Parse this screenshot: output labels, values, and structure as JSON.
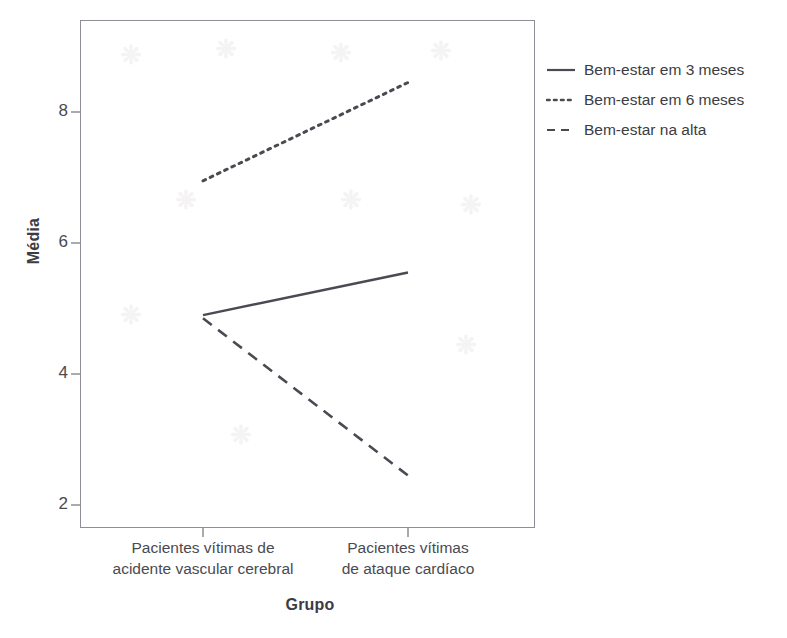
{
  "chart_data": {
    "type": "line",
    "title": "",
    "xlabel": "Grupo",
    "ylabel": "Média",
    "categories": [
      "Pacientes vítimas de\nacidente vascular cerebral",
      "Pacientes vítimas\nde ataque cardíaco"
    ],
    "x": [
      1,
      2
    ],
    "ylim": [
      1.45,
      9.2
    ],
    "yticks": [
      2,
      4,
      6,
      8
    ],
    "ytick_labels": [
      "2",
      "4",
      "6",
      "8"
    ],
    "grid": false,
    "legend_position": "right",
    "series": [
      {
        "name": "Bem-estar em 3 meses",
        "style": "solid",
        "values": [
          4.9,
          5.55
        ]
      },
      {
        "name": "Bem-estar em 6 meses",
        "style": "dotted",
        "values": [
          6.95,
          8.45
        ]
      },
      {
        "name": "Bem-estar na alta",
        "style": "dashed",
        "values": [
          4.85,
          2.45
        ]
      }
    ]
  },
  "axes": {
    "y_title": "Média",
    "x_title": "Grupo",
    "y_tick_labels": [
      "8",
      "6",
      "4",
      "2"
    ],
    "x_tick_labels": [
      "Pacientes vítimas de\nacidente vascular cerebral",
      "Pacientes vítimas\nde ataque cardíaco"
    ]
  },
  "legend": {
    "items": [
      {
        "label": "Bem-estar em 3 meses",
        "style": "solid"
      },
      {
        "label": "Bem-estar em 6 meses",
        "style": "dotted"
      },
      {
        "label": "Bem-estar na alta",
        "style": "dashed"
      }
    ]
  },
  "colors": {
    "line": "#4a4a52",
    "axis": "#8e8e96",
    "text": "#3c3c42",
    "background": "#ffffff"
  }
}
